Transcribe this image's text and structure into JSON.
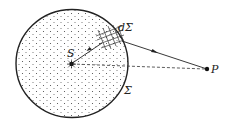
{
  "diagram": {
    "labels": {
      "source": "S",
      "surface_element": "dΣ",
      "surface": "Σ",
      "point": "P"
    },
    "colors": {
      "ink": "#222222",
      "background": "#ffffff"
    },
    "elements": [
      "closed surface Σ (circle) filled with dotted charge distribution",
      "source point S at center",
      "mesh patch dΣ on surface",
      "arrow from S to dΣ",
      "arrow from dΣ to P",
      "dashed line from S to P",
      "external point P"
    ]
  }
}
